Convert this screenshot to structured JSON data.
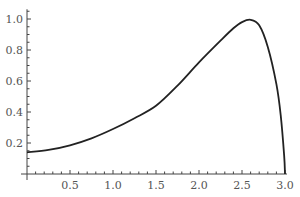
{
  "chart_data": {
    "type": "line",
    "title": "",
    "xlabel": "",
    "ylabel": "",
    "xlim": [
      0,
      3.0
    ],
    "ylim": [
      0,
      1.05
    ],
    "grid": false,
    "x_ticks": [
      0.5,
      1.0,
      1.5,
      2.0,
      2.5,
      3.0
    ],
    "x_tick_labels": [
      "0.5",
      "1.0",
      "1.5",
      "2.0",
      "2.5",
      "3.0"
    ],
    "y_ticks": [
      0.2,
      0.4,
      0.6,
      0.8,
      1.0
    ],
    "y_tick_labels": [
      "0.2",
      "0.4",
      "0.6",
      "0.8",
      "1.0"
    ],
    "series": [
      {
        "name": "curve",
        "color": "#222222",
        "x": [
          0.0,
          0.25,
          0.5,
          0.75,
          1.0,
          1.25,
          1.5,
          1.75,
          2.0,
          2.25,
          2.4,
          2.5,
          2.6,
          2.7,
          2.8,
          2.9,
          2.95,
          2.99,
          3.0
        ],
        "y": [
          0.14,
          0.155,
          0.185,
          0.23,
          0.29,
          0.36,
          0.44,
          0.57,
          0.72,
          0.86,
          0.94,
          0.98,
          0.995,
          0.96,
          0.82,
          0.58,
          0.38,
          0.12,
          0.0
        ]
      }
    ]
  }
}
